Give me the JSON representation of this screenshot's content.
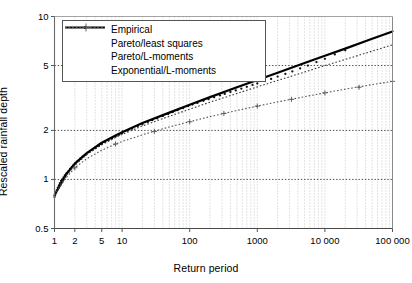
{
  "chart_data": {
    "type": "line",
    "title": "",
    "xlabel": "Return period",
    "ylabel": "Rescaled rainfall depth",
    "xscale": "log",
    "yscale": "log",
    "xlim": [
      1,
      100000
    ],
    "ylim": [
      0.5,
      10
    ],
    "grid": true,
    "grid_style": "dotted",
    "legend_position": "top-left-inside",
    "xticks": [
      {
        "value": 1,
        "label": "1"
      },
      {
        "value": 2,
        "label": "2"
      },
      {
        "value": 5,
        "label": "5"
      },
      {
        "value": 10,
        "label": "10"
      },
      {
        "value": 100,
        "label": "100"
      },
      {
        "value": 1000,
        "label": "1000"
      },
      {
        "value": 10000,
        "label": "10 000"
      },
      {
        "value": 100000,
        "label": "100 000"
      }
    ],
    "yticks": [
      {
        "value": 0.5,
        "label": "0.5"
      },
      {
        "value": 1,
        "label": "1"
      },
      {
        "value": 2,
        "label": "2"
      },
      {
        "value": 5,
        "label": "5"
      },
      {
        "value": 10,
        "label": "10"
      }
    ],
    "series": [
      {
        "name": "Empirical",
        "style": "points",
        "marker": "dot",
        "color": "#111111",
        "points": [
          [
            1.0,
            0.78
          ],
          [
            1.02,
            0.8
          ],
          [
            1.05,
            0.83
          ],
          [
            1.08,
            0.86
          ],
          [
            1.12,
            0.89
          ],
          [
            1.16,
            0.92
          ],
          [
            1.2,
            0.95
          ],
          [
            1.25,
            0.98
          ],
          [
            1.3,
            1.0
          ],
          [
            1.36,
            1.03
          ],
          [
            1.42,
            1.06
          ],
          [
            1.5,
            1.09
          ],
          [
            1.6,
            1.12
          ],
          [
            1.7,
            1.16
          ],
          [
            1.8,
            1.19
          ],
          [
            1.9,
            1.22
          ],
          [
            2.0,
            1.25
          ],
          [
            2.2,
            1.3
          ],
          [
            2.4,
            1.34
          ],
          [
            2.6,
            1.38
          ],
          [
            2.9,
            1.42
          ],
          [
            3.2,
            1.47
          ],
          [
            3.6,
            1.52
          ],
          [
            4.0,
            1.56
          ],
          [
            4.5,
            1.61
          ],
          [
            5.0,
            1.65
          ],
          [
            5.6,
            1.7
          ],
          [
            6.3,
            1.74
          ],
          [
            7.1,
            1.79
          ],
          [
            8.0,
            1.83
          ],
          [
            9.0,
            1.88
          ],
          [
            10.0,
            1.92
          ],
          [
            12.0,
            1.99
          ],
          [
            14.0,
            2.05
          ],
          [
            17.0,
            2.12
          ],
          [
            20.0,
            2.18
          ],
          [
            24.0,
            2.25
          ],
          [
            28.0,
            2.31
          ],
          [
            33.0,
            2.37
          ],
          [
            40.0,
            2.45
          ],
          [
            48.0,
            2.52
          ],
          [
            56.0,
            2.59
          ],
          [
            66.0,
            2.66
          ],
          [
            80.0,
            2.74
          ],
          [
            95.0,
            2.82
          ],
          [
            110.0,
            2.88
          ],
          [
            130.0,
            2.95
          ],
          [
            160.0,
            3.04
          ],
          [
            190.0,
            3.11
          ],
          [
            230.0,
            3.19
          ],
          [
            280.0,
            3.28
          ],
          [
            330.0,
            3.35
          ],
          [
            400.0,
            3.44
          ],
          [
            480.0,
            3.52
          ],
          [
            580.0,
            3.61
          ],
          [
            700.0,
            3.7
          ],
          [
            850.0,
            3.8
          ],
          [
            1000.0,
            3.88
          ],
          [
            1300.0,
            4.02
          ],
          [
            1600.0,
            4.14
          ],
          [
            2000.0,
            4.28
          ],
          [
            2600.0,
            4.44
          ],
          [
            3300.0,
            4.6
          ],
          [
            4300.0,
            4.8
          ],
          [
            5600.0,
            5.0
          ],
          [
            7500.0,
            5.25
          ],
          [
            10000.0,
            5.5
          ],
          [
            14000.0,
            5.85
          ],
          [
            20000.0,
            6.2
          ]
        ]
      },
      {
        "name": "Pareto/least squares",
        "style": "solid",
        "color": "#000000",
        "width": 2.2,
        "points": [
          [
            1.0,
            0.8
          ],
          [
            1.5,
            1.08
          ],
          [
            2.0,
            1.25
          ],
          [
            3.0,
            1.45
          ],
          [
            5.0,
            1.68
          ],
          [
            8.0,
            1.86
          ],
          [
            10.0,
            1.95
          ],
          [
            20.0,
            2.22
          ],
          [
            50.0,
            2.57
          ],
          [
            100.0,
            2.87
          ],
          [
            200.0,
            3.2
          ],
          [
            500.0,
            3.68
          ],
          [
            1000.0,
            4.08
          ],
          [
            2000.0,
            4.52
          ],
          [
            5000.0,
            5.18
          ],
          [
            10000.0,
            5.75
          ],
          [
            20000.0,
            6.35
          ],
          [
            50000.0,
            7.3
          ],
          [
            100000.0,
            8.1
          ]
        ]
      },
      {
        "name": "Pareto/L-moments",
        "style": "dotted",
        "color": "#3a3a3a",
        "width": 1.1,
        "points": [
          [
            1.0,
            0.82
          ],
          [
            1.5,
            1.06
          ],
          [
            2.0,
            1.22
          ],
          [
            3.0,
            1.42
          ],
          [
            5.0,
            1.63
          ],
          [
            8.0,
            1.81
          ],
          [
            10.0,
            1.89
          ],
          [
            20.0,
            2.13
          ],
          [
            50.0,
            2.44
          ],
          [
            100.0,
            2.7
          ],
          [
            200.0,
            2.98
          ],
          [
            500.0,
            3.37
          ],
          [
            1000.0,
            3.7
          ],
          [
            2000.0,
            4.05
          ],
          [
            5000.0,
            4.56
          ],
          [
            10000.0,
            5.0
          ],
          [
            20000.0,
            5.45
          ],
          [
            50000.0,
            6.13
          ],
          [
            100000.0,
            6.7
          ]
        ]
      },
      {
        "name": "Exponential/L-moments",
        "style": "dotted-plus",
        "marker": "plus",
        "color": "#555555",
        "width": 1.1,
        "points": [
          [
            1.0,
            0.8
          ],
          [
            1.5,
            1.03
          ],
          [
            2.0,
            1.18
          ],
          [
            3.0,
            1.34
          ],
          [
            5.0,
            1.51
          ],
          [
            8.0,
            1.65
          ],
          [
            10.0,
            1.71
          ],
          [
            20.0,
            1.88
          ],
          [
            50.0,
            2.1
          ],
          [
            100.0,
            2.26
          ],
          [
            200.0,
            2.43
          ],
          [
            500.0,
            2.65
          ],
          [
            1000.0,
            2.82
          ],
          [
            2000.0,
            2.99
          ],
          [
            5000.0,
            3.22
          ],
          [
            10000.0,
            3.4
          ],
          [
            20000.0,
            3.58
          ],
          [
            50000.0,
            3.82
          ],
          [
            100000.0,
            4.0
          ]
        ],
        "marker_points": [
          [
            2.0,
            1.18
          ],
          [
            8.0,
            1.65
          ],
          [
            30.0,
            1.97
          ],
          [
            100.0,
            2.26
          ],
          [
            320.0,
            2.54
          ],
          [
            1000.0,
            2.82
          ],
          [
            3200.0,
            3.1
          ],
          [
            10000.0,
            3.4
          ],
          [
            32000.0,
            3.68
          ],
          [
            100000.0,
            4.0
          ]
        ]
      }
    ]
  },
  "legend": {
    "items": [
      {
        "label": "Empirical",
        "key": "dot"
      },
      {
        "label": "Pareto/least squares",
        "key": "solid-line"
      },
      {
        "label": "Pareto/L-moments",
        "key": "dotted-line"
      },
      {
        "label": "Exponential/L-moments",
        "key": "dotted-plus-line"
      }
    ]
  },
  "axes": {
    "x_axis_label": "Return period",
    "y_axis_label": "Rescaled rainfall depth"
  }
}
